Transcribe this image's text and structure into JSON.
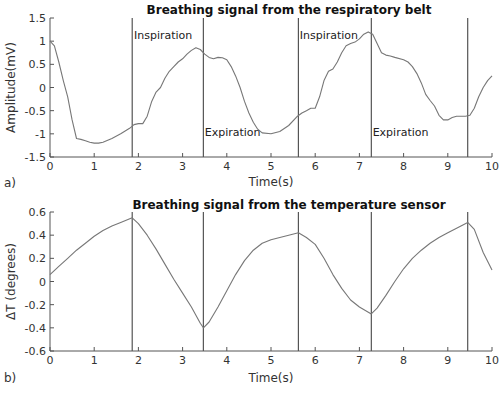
{
  "chart_data": [
    {
      "type": "line",
      "panel_label": "a)",
      "title": "Breathing signal from the respiratory belt",
      "xlabel": "Time(s)",
      "ylabel": "Amplitude(mV)",
      "xlim": [
        0,
        10
      ],
      "ylim": [
        -1.5,
        1.5
      ],
      "xticks": [
        "0",
        "1",
        "2",
        "3",
        "4",
        "5",
        "6",
        "7",
        "8",
        "9",
        "10"
      ],
      "yticks": [
        "1.5",
        "1",
        "0.5",
        "0",
        "-0.5",
        "-1",
        "-1.5"
      ],
      "grid": false,
      "vertical_lines": [
        1.86,
        3.47,
        5.62,
        7.27,
        9.45
      ],
      "annotations": [
        {
          "text": "Inspiration",
          "x": 1.9,
          "y": 1.05
        },
        {
          "text": "Expiration",
          "x": 3.5,
          "y": -1.05
        },
        {
          "text": "Inspiration",
          "x": 5.65,
          "y": 1.05
        },
        {
          "text": "Expiration",
          "x": 7.3,
          "y": -1.05
        }
      ],
      "series": [
        {
          "name": "respiratory belt",
          "x": [
            0,
            0.1,
            0.2,
            0.3,
            0.4,
            0.5,
            0.6,
            0.7,
            0.8,
            0.9,
            1.0,
            1.1,
            1.2,
            1.4,
            1.6,
            1.8,
            1.9,
            2.0,
            2.1,
            2.2,
            2.3,
            2.4,
            2.5,
            2.6,
            2.7,
            2.8,
            2.9,
            3.0,
            3.1,
            3.2,
            3.3,
            3.4,
            3.5,
            3.6,
            3.7,
            3.8,
            3.9,
            4.0,
            4.1,
            4.2,
            4.3,
            4.4,
            4.5,
            4.6,
            4.7,
            4.8,
            5.0,
            5.2,
            5.4,
            5.6,
            5.7,
            5.8,
            5.9,
            6.0,
            6.1,
            6.2,
            6.3,
            6.4,
            6.5,
            6.6,
            6.7,
            6.8,
            6.9,
            7.0,
            7.1,
            7.2,
            7.3,
            7.4,
            7.5,
            7.6,
            7.7,
            7.8,
            8.0,
            8.1,
            8.2,
            8.3,
            8.4,
            8.5,
            8.6,
            8.7,
            8.8,
            8.9,
            9.0,
            9.1,
            9.2,
            9.3,
            9.4,
            9.5,
            9.6,
            9.7,
            9.8,
            9.9,
            10.0
          ],
          "values": [
            1.0,
            0.9,
            0.55,
            0.15,
            -0.2,
            -0.7,
            -1.1,
            -1.12,
            -1.15,
            -1.18,
            -1.2,
            -1.2,
            -1.18,
            -1.1,
            -1.0,
            -0.88,
            -0.8,
            -0.78,
            -0.78,
            -0.62,
            -0.3,
            -0.1,
            0.0,
            0.2,
            0.35,
            0.45,
            0.55,
            0.62,
            0.72,
            0.8,
            0.86,
            0.82,
            0.72,
            0.65,
            0.62,
            0.65,
            0.64,
            0.6,
            0.45,
            0.25,
            0.0,
            -0.3,
            -0.55,
            -0.75,
            -0.9,
            -0.98,
            -1.0,
            -0.95,
            -0.82,
            -0.62,
            -0.55,
            -0.5,
            -0.45,
            -0.45,
            -0.2,
            0.15,
            0.35,
            0.4,
            0.55,
            0.75,
            0.9,
            0.95,
            0.98,
            1.05,
            1.15,
            1.2,
            1.15,
            0.95,
            0.75,
            0.7,
            0.68,
            0.65,
            0.6,
            0.55,
            0.45,
            0.3,
            0.1,
            -0.15,
            -0.28,
            -0.4,
            -0.6,
            -0.7,
            -0.7,
            -0.65,
            -0.62,
            -0.62,
            -0.62,
            -0.6,
            -0.45,
            -0.2,
            0.0,
            0.15,
            0.25
          ]
        }
      ]
    },
    {
      "type": "line",
      "panel_label": "b)",
      "title": "Breathing signal from the temperature sensor",
      "xlabel": "Time(s)",
      "ylabel": "ΔT (degrees)",
      "xlim": [
        0,
        10
      ],
      "ylim": [
        -0.6,
        0.6
      ],
      "xticks": [
        "0",
        "1",
        "2",
        "3",
        "4",
        "5",
        "6",
        "7",
        "8",
        "9",
        "10"
      ],
      "yticks": [
        "0.6",
        "0.4",
        "0.2",
        "0",
        "-0.2",
        "-0.4",
        "-0.6"
      ],
      "grid": false,
      "vertical_lines": [
        1.86,
        3.47,
        5.62,
        7.27,
        9.45
      ],
      "series": [
        {
          "name": "temperature sensor",
          "x": [
            0,
            0.2,
            0.4,
            0.6,
            0.8,
            1.0,
            1.2,
            1.4,
            1.6,
            1.86,
            2.0,
            2.2,
            2.4,
            2.6,
            2.8,
            3.0,
            3.2,
            3.4,
            3.47,
            3.6,
            3.8,
            4.0,
            4.2,
            4.4,
            4.6,
            4.8,
            5.0,
            5.2,
            5.4,
            5.62,
            5.8,
            6.0,
            6.2,
            6.4,
            6.6,
            6.8,
            7.0,
            7.27,
            7.4,
            7.6,
            7.8,
            8.0,
            8.2,
            8.4,
            8.6,
            8.8,
            9.0,
            9.2,
            9.45,
            9.6,
            9.8,
            10.0
          ],
          "values": [
            0.06,
            0.13,
            0.2,
            0.27,
            0.33,
            0.39,
            0.44,
            0.48,
            0.51,
            0.55,
            0.5,
            0.4,
            0.28,
            0.15,
            0.02,
            -0.1,
            -0.22,
            -0.36,
            -0.4,
            -0.35,
            -0.22,
            -0.08,
            0.06,
            0.18,
            0.27,
            0.33,
            0.36,
            0.38,
            0.4,
            0.42,
            0.38,
            0.32,
            0.2,
            0.06,
            -0.06,
            -0.16,
            -0.22,
            -0.28,
            -0.23,
            -0.12,
            0.0,
            0.11,
            0.2,
            0.27,
            0.33,
            0.38,
            0.42,
            0.46,
            0.51,
            0.45,
            0.25,
            0.1
          ]
        }
      ]
    }
  ]
}
